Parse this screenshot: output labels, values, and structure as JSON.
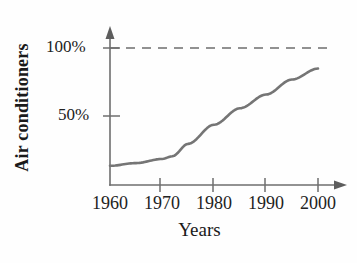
{
  "chart_data": {
    "type": "line",
    "title": "",
    "xlabel": "Years",
    "ylabel": "Air conditioners",
    "xlim": [
      1960,
      2000
    ],
    "ylim": [
      0,
      110
    ],
    "grid": false,
    "legend": "none",
    "x_tick_labels": [
      "1960",
      "1970",
      "1980",
      "1990",
      "2000"
    ],
    "x_ticks": [
      1960,
      1970,
      1980,
      1990,
      2000
    ],
    "y_tick_labels": [
      "50%",
      "100%"
    ],
    "y_ticks": [
      50,
      100
    ],
    "annotations": [
      {
        "name": "saturation-reference-line",
        "style": "dashed",
        "y_value": 100,
        "label": "100%"
      }
    ],
    "series": [
      {
        "name": "Air conditioners adoption",
        "style": "solid",
        "color": "#757575",
        "x": [
          1960,
          1965,
          1970,
          1972,
          1975,
          1980,
          1985,
          1990,
          1995,
          2000
        ],
        "values": [
          14,
          16,
          19,
          21,
          30,
          44,
          56,
          66,
          77,
          85
        ]
      }
    ]
  },
  "axis": {
    "y_label": "Air conditioners",
    "x_label": "Years",
    "y_tick_100": "100%",
    "y_tick_50": "50%",
    "x_tick_1960": "1960",
    "x_tick_1970": "1970",
    "x_tick_1980": "1980",
    "x_tick_1990": "1990",
    "x_tick_2000": "2000"
  },
  "colors": {
    "curve": "#757575",
    "axis": "#6e6e6e",
    "text": "#1a1a1a",
    "background": "#fefefe"
  }
}
